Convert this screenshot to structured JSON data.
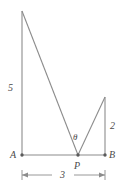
{
  "figure": {
    "background_color": "#ffffff",
    "line_color": "#8c8c8c",
    "label_color": "#4a4a4a",
    "points": {
      "A": {
        "label": "A",
        "x": 22,
        "y": 155
      },
      "B": {
        "label": "B",
        "x": 105,
        "y": 155
      },
      "P": {
        "label": "P",
        "x": 78,
        "y": 155
      },
      "left_apex": {
        "label": "",
        "x": 22,
        "y": 11
      },
      "right_apex": {
        "label": "",
        "x": 105,
        "y": 97
      }
    },
    "segments": [
      {
        "name": "baseline-AB",
        "from": "A",
        "to": "B"
      },
      {
        "name": "left-vertical",
        "from": "A",
        "to": "left_apex"
      },
      {
        "name": "left-hypotenuse",
        "from": "left_apex",
        "to": "P"
      },
      {
        "name": "right-hypotenuse",
        "from": "P",
        "to": "right_apex"
      },
      {
        "name": "right-vertical",
        "from": "right_apex",
        "to": "B"
      }
    ],
    "measurements": {
      "left_side": "5",
      "right_side": "2",
      "base_dimension": "3"
    },
    "angle": {
      "symbol": "θ",
      "at_point": "P"
    },
    "dimension_line": {
      "value": "3",
      "from_x": 22,
      "to_x": 105,
      "y": 175
    }
  }
}
